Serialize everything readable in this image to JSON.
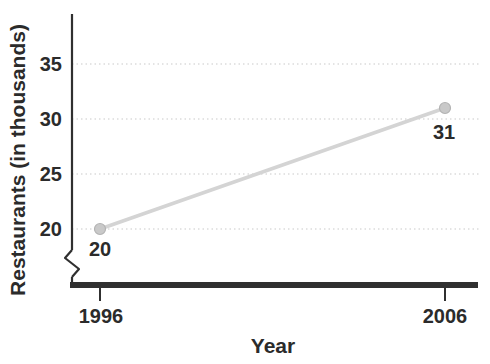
{
  "chart_data": {
    "type": "line",
    "title": "",
    "xlabel": "Year",
    "ylabel": "Restaurants (in thousands)",
    "x": [
      1996,
      2006
    ],
    "values": [
      20,
      31
    ],
    "categories": [
      "1996",
      "2006"
    ],
    "point_labels": [
      "20",
      "31"
    ],
    "yticks": [
      35,
      30,
      25,
      20
    ],
    "ytick_labels": [
      "35",
      "30",
      "25",
      "20"
    ],
    "ylim": [
      20,
      39
    ],
    "xlim": [
      1996,
      2006
    ],
    "axis_break_on_y": true,
    "grid": "horizontal-dotted",
    "legend": "none",
    "colors": {
      "line": "#d4d4d4",
      "marker_fill": "#c9c9c9",
      "marker_stroke": "#b3b3b3",
      "axis": "#303030",
      "grid": "#dcdcdc",
      "text": "#2b2b2b",
      "background": "#ffffff"
    }
  }
}
